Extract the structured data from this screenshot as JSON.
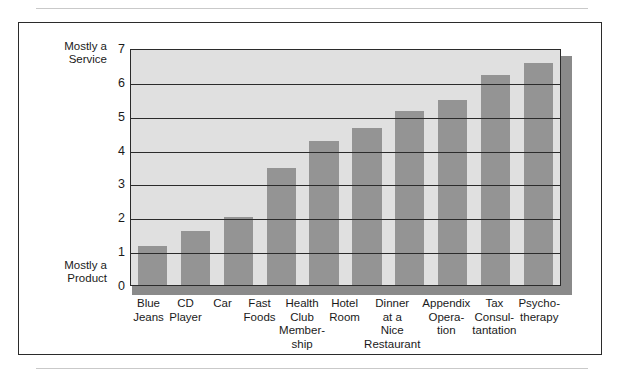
{
  "chart_data": {
    "type": "bar",
    "title": "",
    "subtitle": "",
    "xlabel": "",
    "ylabel": "",
    "ylim": [
      0,
      7
    ],
    "yticks": [
      0,
      1,
      2,
      3,
      4,
      5,
      6,
      7
    ],
    "ytick_labels": [
      "0",
      "1",
      "2",
      "3",
      "4",
      "5",
      "6",
      "7"
    ],
    "grid": true,
    "legend": "none",
    "axis_top_annotation": "Mostly a\nService",
    "axis_bottom_annotation": "Mostly a\nProduct",
    "categories": [
      "Blue\nJeans",
      "CD\nPlayer",
      "Car",
      "Fast\nFoods",
      "Health\nClub\nMember-\nship",
      "Hotel\nRoom",
      "Dinner\nat a\nNice\nRestaurant",
      "Appendix\nOpera-\ntion",
      "Tax\nConsul-\ntantation",
      "Psycho-\ntherapy"
    ],
    "values": [
      1.15,
      1.6,
      2.0,
      3.45,
      4.25,
      4.65,
      5.15,
      5.45,
      6.2,
      6.55
    ],
    "colors": {
      "bar": "#949494",
      "plot_background": "#e0e0e0",
      "axis": "#2b2b2b",
      "shadow": "#8a8a8a",
      "page_rule": "#c9c9c9",
      "text": "#1a1a1a"
    }
  }
}
